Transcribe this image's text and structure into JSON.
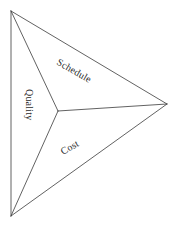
{
  "diagram": {
    "type": "concave-triangle-dart",
    "background_color": "#ffffff",
    "line_color": "#3a3a3a",
    "text_color": "#2b2b2b",
    "vertices": {
      "top_left": [
        11,
        11
      ],
      "bottom_left": [
        11,
        216
      ],
      "right": [
        167,
        104
      ],
      "center": [
        58,
        111
      ]
    },
    "labels": {
      "quality": "Quality",
      "schedule": "Schedule",
      "cost": "Cost"
    },
    "label_rotations": {
      "quality": 90,
      "schedule": 30,
      "cost": -30
    },
    "label_positions": {
      "quality": [
        26,
        89
      ],
      "schedule": [
        56,
        64
      ],
      "cost": [
        63,
        155
      ]
    }
  }
}
